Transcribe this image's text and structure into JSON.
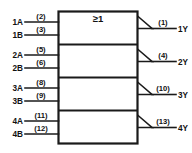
{
  "diagram": {
    "gate_symbol": "≥1",
    "line_color": "#1a1a1a",
    "background": "#ffffff",
    "sections": [
      {
        "id": "gate-1",
        "inputs": [
          {
            "label": "1A",
            "pin": "(2)"
          },
          {
            "label": "1B",
            "pin": "(3)"
          }
        ],
        "output": {
          "label": "1Y",
          "pin": "(1)"
        }
      },
      {
        "id": "gate-2",
        "inputs": [
          {
            "label": "2A",
            "pin": "(5)"
          },
          {
            "label": "2B",
            "pin": "(6)"
          }
        ],
        "output": {
          "label": "2Y",
          "pin": "(4)"
        }
      },
      {
        "id": "gate-3",
        "inputs": [
          {
            "label": "3A",
            "pin": "(8)"
          },
          {
            "label": "3B",
            "pin": "(9)"
          }
        ],
        "output": {
          "label": "3Y",
          "pin": "(10)"
        }
      },
      {
        "id": "gate-4",
        "inputs": [
          {
            "label": "4A",
            "pin": "(11)"
          },
          {
            "label": "4B",
            "pin": "(12)"
          }
        ],
        "output": {
          "label": "4Y",
          "pin": "(13)"
        }
      }
    ]
  }
}
